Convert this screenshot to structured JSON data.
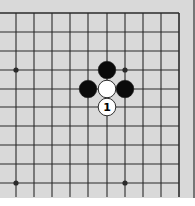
{
  "diagram": {
    "type": "go-board-fragment",
    "colors": {
      "background": "#d9d9d9",
      "grid_line": "#2a2a2a",
      "black_stone": "#0a0a0a",
      "white_stone": "#ffffff",
      "stone_outline": "#1a1a1a"
    },
    "grid": {
      "x": [
        16,
        34,
        52,
        70,
        88,
        107,
        125,
        143,
        161,
        179
      ],
      "y": [
        13,
        32,
        51,
        70,
        89,
        107,
        126,
        145,
        164,
        183
      ],
      "right_edge": true,
      "top_edge": true
    },
    "star_points": [
      {
        "col": 0,
        "row": 3
      },
      {
        "col": 6,
        "row": 3
      },
      {
        "col": 0,
        "row": 9
      },
      {
        "col": 6,
        "row": 9
      }
    ],
    "stones": [
      {
        "color": "black",
        "col": 5,
        "row": 3,
        "label": ""
      },
      {
        "color": "black",
        "col": 4,
        "row": 4,
        "label": ""
      },
      {
        "color": "black",
        "col": 6,
        "row": 4,
        "label": ""
      },
      {
        "color": "white",
        "col": 5,
        "row": 4,
        "label": ""
      },
      {
        "color": "white",
        "col": 5,
        "row": 5,
        "label": "1"
      }
    ]
  }
}
